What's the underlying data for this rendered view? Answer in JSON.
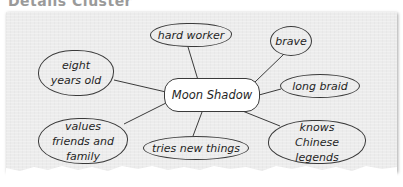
{
  "title": "Details Cluster",
  "diagram": {
    "center": {
      "label": "Moon Shadow"
    },
    "details": [
      {
        "id": "hard-worker",
        "label": "hard worker"
      },
      {
        "id": "brave",
        "label": "brave"
      },
      {
        "id": "eight-years-old",
        "label": "eight years old"
      },
      {
        "id": "long-braid",
        "label": "long braid"
      },
      {
        "id": "values-friends-family",
        "label": "values friends and family"
      },
      {
        "id": "tries-new-things",
        "label": "tries new things"
      },
      {
        "id": "knows-chinese-legends",
        "label": "knows Chinese legends"
      }
    ]
  },
  "colors": {
    "paper": "#ececec",
    "line": "#3a3a3a",
    "title": "#9a9a9a",
    "center_fill": "#ffffff"
  }
}
